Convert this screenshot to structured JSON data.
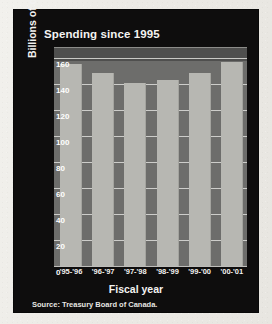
{
  "card": {
    "background_color": "#0e0d0d",
    "page_background_color": "#efeeea"
  },
  "chart_data": {
    "type": "bar",
    "title": "Spending since 1995",
    "xlabel": "Fiscal year",
    "ylabel": "Billions of dollars",
    "categories": [
      "'95-'96",
      "'96-'97",
      "'97-'98",
      "'98-'99",
      "'99-'00",
      "'00-'01"
    ],
    "values": [
      156,
      149,
      141,
      143,
      149,
      157
    ],
    "ylim": [
      0,
      168
    ],
    "yticks": [
      0,
      20,
      40,
      60,
      80,
      100,
      120,
      140,
      160
    ],
    "ytick_labels": [
      "0",
      "20",
      "40",
      "60",
      "80",
      "100",
      "120",
      "140",
      "160"
    ],
    "grid": true,
    "legend": false,
    "bar_color": "#b7b7b2",
    "plot_background_color": "#6d6d6b",
    "gridline_color": "#dededa",
    "text_color": "#ffffff",
    "source": "Source: Treasury Board of Canada."
  }
}
